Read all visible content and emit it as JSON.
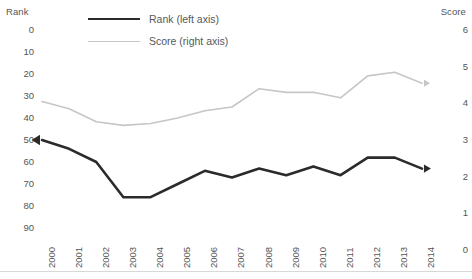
{
  "chart_data": {
    "type": "line",
    "title": "",
    "xlabel": "",
    "categories": [
      "2000",
      "2001",
      "2002",
      "2003",
      "2004",
      "2005",
      "2006",
      "2007",
      "2008",
      "2009",
      "2010",
      "2011",
      "2012",
      "2013",
      "2014"
    ],
    "grid": false,
    "legend_position": "top-center",
    "axes": {
      "left": {
        "name": "Rank",
        "label": "Rank",
        "ticks": [
          0,
          10,
          20,
          30,
          40,
          50,
          60,
          70,
          80,
          90
        ],
        "ylim": [
          0,
          90
        ],
        "inverted": true
      },
      "right": {
        "name": "Score",
        "label": "Score",
        "ticks": [
          6,
          5,
          4,
          3,
          2,
          1,
          0
        ],
        "ylim": [
          0,
          6
        ],
        "inverted": false
      }
    },
    "series": [
      {
        "name": "Rank (left axis)",
        "legend_label": "Rank (left axis)",
        "axis": "left",
        "color": "#2b2b2b",
        "width": 2.6,
        "end_marker": "arrow-right",
        "start_marker": "arrow-left",
        "values": [
          50,
          54,
          60,
          76,
          76,
          70,
          64,
          67,
          63,
          66,
          62,
          66,
          58,
          58,
          63
        ]
      },
      {
        "name": "Score (right axis)",
        "legend_label": "Score (right axis)",
        "axis": "right",
        "color": "#c6c6c6",
        "width": 1.6,
        "end_marker": "arrow-right",
        "values": [
          4.05,
          3.85,
          3.5,
          3.4,
          3.45,
          3.6,
          3.8,
          3.9,
          4.4,
          4.3,
          4.3,
          4.15,
          4.75,
          4.85,
          4.55
        ]
      }
    ]
  },
  "colors": {
    "rank_line": "#2b2b2b",
    "score_line": "#c6c6c6",
    "text": "#555555",
    "baseline": "#d8d8d8",
    "background": "#ffffff"
  }
}
